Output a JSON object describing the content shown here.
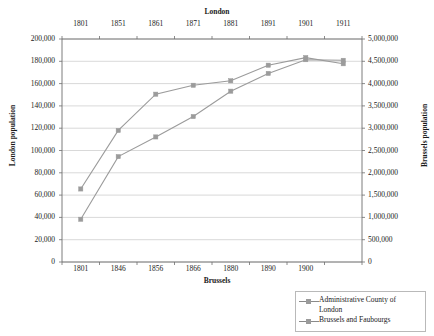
{
  "chart_data": {
    "type": "line",
    "title": "",
    "top_axis": {
      "label": "London",
      "ticks": [
        "1801",
        "1851",
        "1861",
        "1871",
        "1881",
        "1891",
        "1901",
        "1911"
      ]
    },
    "bottom_axis": {
      "label": "Brussels",
      "ticks": [
        "1801",
        "1846",
        "1856",
        "1866",
        "1880",
        "1890",
        "1900"
      ]
    },
    "left_axis": {
      "label": "London population",
      "ticks": [
        "0",
        "20,000",
        "40,000",
        "60,000",
        "80,000",
        "100,000",
        "120,000",
        "140,000",
        "160,000",
        "180,000",
        "200,000"
      ],
      "ylim": [
        0,
        200000
      ]
    },
    "right_axis": {
      "label": "Brussels population",
      "ticks": [
        "0",
        "500,000",
        "1,000,000",
        "1,500,000",
        "2,000,000",
        "2,500,000",
        "3,000,000",
        "3,500,000",
        "4,000,000",
        "4,500,000",
        "5,000,000"
      ],
      "ylim": [
        0,
        5000000
      ]
    },
    "grid": true,
    "legend_position": "bottom-right",
    "x": [
      0,
      1,
      2,
      3,
      4,
      5,
      6,
      7
    ],
    "series": [
      {
        "name": "Administrative County of London",
        "axis": "right",
        "color": "#9b9b9b",
        "marker": "square",
        "categories": [
          "1801",
          "1851",
          "1861",
          "1871",
          "1881",
          "1891",
          "1901",
          "1911"
        ],
        "values": [
          958000,
          2363000,
          2804000,
          3261000,
          3830000,
          4228000,
          4536000,
          4522000
        ],
        "values_left_scale": [
          38300,
          94500,
          112150,
          130450,
          153200,
          169100,
          181450,
          180900
        ]
      },
      {
        "name": "Brussels and Faubourgs",
        "axis": "left",
        "color": "#9b9b9b",
        "marker": "square",
        "categories": [
          "1801",
          "1846",
          "1856",
          "1866",
          "1880",
          "1890",
          "1900",
          "1910"
        ],
        "values": [
          65500,
          118000,
          150500,
          158500,
          162500,
          176500,
          183300,
          177800
        ]
      }
    ]
  },
  "legend": {
    "items": [
      {
        "label_line1": "Administrative County of",
        "label_line2": "London"
      },
      {
        "label_line1": "Brussels and Faubourgs",
        "label_line2": ""
      }
    ]
  }
}
